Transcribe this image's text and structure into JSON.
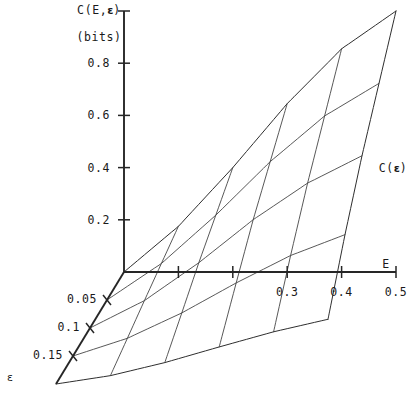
{
  "figure": {
    "background": "#ffffff",
    "ink_color": "#1a1a1a",
    "mesh_color": "#3a3a3a"
  },
  "labels": {
    "vertical_axis": "C(E,ε)",
    "vertical_axis_units": "(bits)",
    "horizontal_axis": "E",
    "depth_axis": "ε",
    "surface_edge": "C(ε)"
  },
  "ticks": {
    "vertical": [
      "0.2",
      "0.4",
      "0.6",
      "0.8"
    ],
    "horizontal": [
      "0.3",
      "0.4",
      "0.5"
    ],
    "depth": [
      "0.05",
      "0.1",
      "0.15"
    ]
  },
  "chart_data": {
    "type": "line",
    "title": "",
    "subtitle": "",
    "projection": "3d-wireframe-surface",
    "xlabel": "E",
    "ylabel": "C(E,ε)",
    "zlabel": "ε",
    "ylabel_units": "bits",
    "xlim": [
      0,
      0.5
    ],
    "ylim": [
      0,
      1.0
    ],
    "zlim": [
      0,
      0.2
    ],
    "xticks": [
      0.1,
      0.2,
      0.3,
      0.4,
      0.5
    ],
    "xticklabels": [
      "",
      "",
      "0.3",
      "0.4",
      "0.5"
    ],
    "yticks": [
      0.2,
      0.4,
      0.6,
      0.8
    ],
    "yticklabels": [
      "0.2",
      "0.4",
      "0.6",
      "0.8"
    ],
    "zticks": [
      0.05,
      0.1,
      0.15
    ],
    "zticklabels": [
      "0.05",
      "0.1",
      "0.15"
    ],
    "grid": false,
    "legend": false,
    "annotations": [
      {
        "text": "C(ε)",
        "meaning": "capacity curve along the epsilon edge at E=0.5"
      },
      {
        "text": "(bits)",
        "meaning": "units of the vertical capacity axis"
      }
    ],
    "x": [
      0,
      0.1,
      0.2,
      0.3,
      0.4,
      0.5
    ],
    "series": [
      {
        "name": "ε = 0",
        "eps": 0.0,
        "values": [
          0.0,
          0.175,
          0.4,
          0.645,
          0.855,
          1.0
        ]
      },
      {
        "name": "ε = 0.05",
        "eps": 0.05,
        "values": [
          0.0,
          0.14,
          0.325,
          0.53,
          0.705,
          0.83
        ]
      },
      {
        "name": "ε = 0.1",
        "eps": 0.1,
        "values": [
          0.0,
          0.105,
          0.25,
          0.415,
          0.555,
          0.66
        ]
      },
      {
        "name": "ε = 0.15",
        "eps": 0.15,
        "values": [
          0.0,
          0.068,
          0.165,
          0.28,
          0.385,
          0.465
        ]
      },
      {
        "name": "ε = 0.2",
        "eps": 0.2,
        "values": [
          0.0,
          0.032,
          0.082,
          0.142,
          0.2,
          0.248
        ]
      }
    ],
    "cross_sections": {
      "note": "curves of constant E run from ε=0 down to ε=0.2",
      "E_values": [
        0.1,
        0.2,
        0.3,
        0.4,
        0.5
      ]
    }
  }
}
